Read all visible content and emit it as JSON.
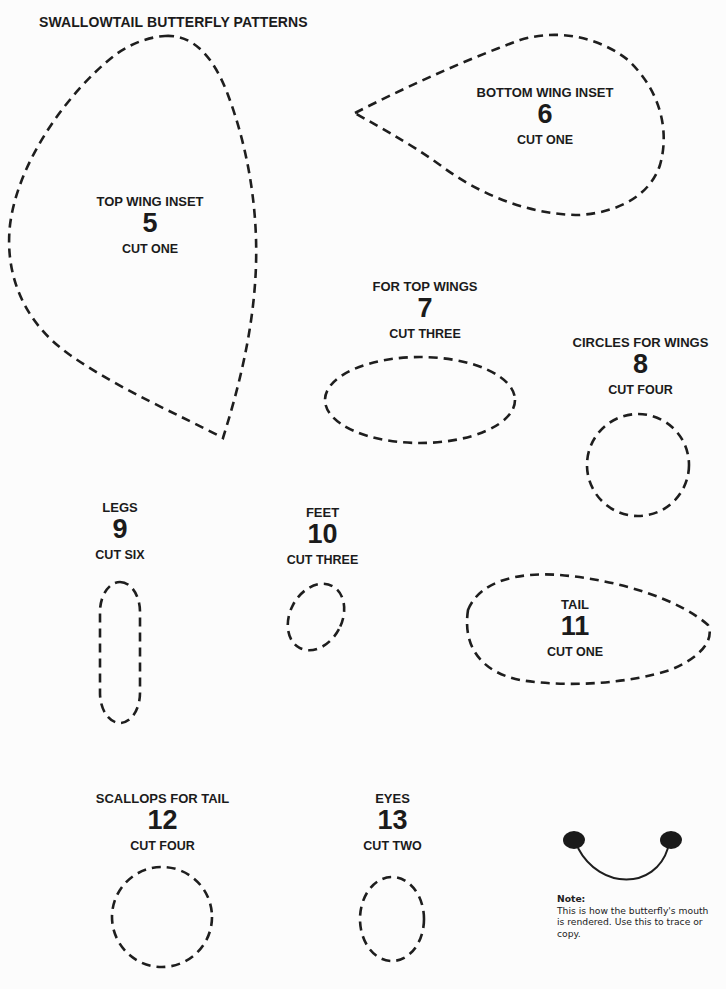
{
  "page": {
    "title": "SWALLOWTAIL BUTTERFLY PATTERNS"
  },
  "patterns": [
    {
      "name": "TOP WING INSET",
      "number": "5",
      "cut": "CUT ONE"
    },
    {
      "name": "BOTTOM WING INSET",
      "number": "6",
      "cut": "CUT ONE"
    },
    {
      "name": "FOR TOP WINGS",
      "number": "7",
      "cut": "CUT THREE"
    },
    {
      "name": "CIRCLES FOR WINGS",
      "number": "8",
      "cut": "CUT FOUR"
    },
    {
      "name": "LEGS",
      "number": "9",
      "cut": "CUT SIX"
    },
    {
      "name": "FEET",
      "number": "10",
      "cut": "CUT THREE"
    },
    {
      "name": "TAIL",
      "number": "11",
      "cut": "CUT ONE"
    },
    {
      "name": "SCALLOPS FOR TAIL",
      "number": "12",
      "cut": "CUT FOUR"
    },
    {
      "name": "EYES",
      "number": "13",
      "cut": "CUT TWO"
    }
  ],
  "note": {
    "title": "Note:",
    "text": "This is how the butterfly's mouth is rendered.  Use this to trace or copy."
  }
}
